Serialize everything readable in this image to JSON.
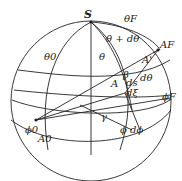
{
  "diagram": {
    "labels": {
      "S": "S",
      "theta_F": "θF",
      "theta_plus_dtheta": "θ + dθ",
      "A_F": "AF",
      "theta_0": "θ0",
      "theta": "θ",
      "A_prime": "A'",
      "beta": "β",
      "d_theta": "dθ",
      "d_s": "ds",
      "A": "A",
      "d_xi": "dξ",
      "phi_F": "ϕF",
      "gamma": "γ",
      "phi_0": "ϕ0",
      "A_0": "A0",
      "phi_dphi": "ϕ  dϕ"
    },
    "colors": {
      "line": "#222222",
      "background": "#ffffff"
    }
  }
}
